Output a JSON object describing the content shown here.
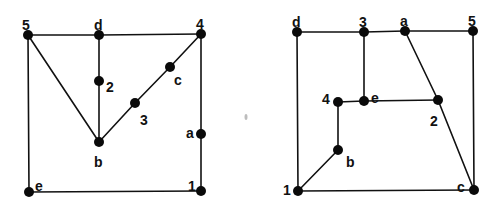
{
  "colors": {
    "ink": "#0a0a0a",
    "background": "#ffffff",
    "speck": "#bdbdbd"
  },
  "graphs": [
    {
      "id": "left",
      "nodes": [
        {
          "id": "5",
          "label": "5",
          "x": 28,
          "y": 35,
          "lx": 22,
          "ly": 25
        },
        {
          "id": "d",
          "label": "d",
          "x": 99,
          "y": 35,
          "lx": 94,
          "ly": 25
        },
        {
          "id": "4",
          "label": "4",
          "x": 201,
          "y": 34,
          "lx": 196,
          "ly": 24
        },
        {
          "id": "2",
          "label": "2",
          "x": 99,
          "y": 81,
          "lx": 106,
          "ly": 87
        },
        {
          "id": "c",
          "label": "c",
          "x": 170,
          "y": 67,
          "lx": 174,
          "ly": 80
        },
        {
          "id": "3",
          "label": "3",
          "x": 135,
          "y": 103,
          "lx": 140,
          "ly": 120
        },
        {
          "id": "b",
          "label": "b",
          "x": 99,
          "y": 142,
          "lx": 94,
          "ly": 162
        },
        {
          "id": "a",
          "label": "a",
          "x": 201,
          "y": 134,
          "lx": 186,
          "ly": 133
        },
        {
          "id": "e",
          "label": "e",
          "x": 29,
          "y": 192,
          "lx": 35,
          "ly": 186
        },
        {
          "id": "1",
          "label": "1",
          "x": 201,
          "y": 191,
          "lx": 188,
          "ly": 186
        }
      ],
      "edges": [
        [
          "5",
          "d"
        ],
        [
          "d",
          "4"
        ],
        [
          "5",
          "e"
        ],
        [
          "e",
          "1"
        ],
        [
          "4",
          "a"
        ],
        [
          "a",
          "1"
        ],
        [
          "d",
          "2"
        ],
        [
          "2",
          "b"
        ],
        [
          "5",
          "b"
        ],
        [
          "b",
          "3"
        ],
        [
          "3",
          "c"
        ],
        [
          "c",
          "4"
        ]
      ]
    },
    {
      "id": "right",
      "nodes": [
        {
          "id": "d",
          "label": "d",
          "x": 297,
          "y": 32,
          "lx": 292,
          "ly": 22
        },
        {
          "id": "3",
          "label": "3",
          "x": 364,
          "y": 32,
          "lx": 359,
          "ly": 22
        },
        {
          "id": "a",
          "label": "a",
          "x": 405,
          "y": 31,
          "lx": 400,
          "ly": 21
        },
        {
          "id": "5",
          "label": "5",
          "x": 473,
          "y": 31,
          "lx": 468,
          "ly": 21
        },
        {
          "id": "4",
          "label": "4",
          "x": 338,
          "y": 102,
          "lx": 322,
          "ly": 99
        },
        {
          "id": "e",
          "label": "e",
          "x": 364,
          "y": 101,
          "lx": 371,
          "ly": 98
        },
        {
          "id": "2",
          "label": "2",
          "x": 438,
          "y": 100,
          "lx": 430,
          "ly": 121
        },
        {
          "id": "b",
          "label": "b",
          "x": 338,
          "y": 150,
          "lx": 346,
          "ly": 162
        },
        {
          "id": "1",
          "label": "1",
          "x": 298,
          "y": 191,
          "lx": 283,
          "ly": 190
        },
        {
          "id": "c",
          "label": "c",
          "x": 474,
          "y": 190,
          "lx": 457,
          "ly": 187
        }
      ],
      "edges": [
        [
          "d",
          "3"
        ],
        [
          "3",
          "a"
        ],
        [
          "a",
          "5"
        ],
        [
          "d",
          "1"
        ],
        [
          "5",
          "c"
        ],
        [
          "1",
          "c"
        ],
        [
          "3",
          "e"
        ],
        [
          "4",
          "e"
        ],
        [
          "e",
          "2"
        ],
        [
          "a",
          "2"
        ],
        [
          "2",
          "c"
        ],
        [
          "4",
          "b"
        ],
        [
          "b",
          "1"
        ]
      ]
    }
  ],
  "artifacts": [
    {
      "id": "speck",
      "x": 246,
      "y": 117
    }
  ]
}
